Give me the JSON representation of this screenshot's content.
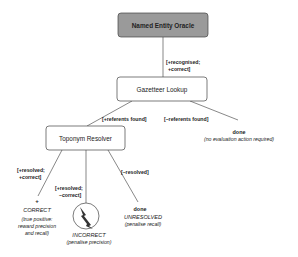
{
  "diagram": {
    "type": "decision-tree",
    "nodes": {
      "oracle": {
        "label": "Named Entity Oracle",
        "fill": "#9a9a9a"
      },
      "gazetteer": {
        "label": "Gazetteer Lookup",
        "fill": "#ffffff"
      },
      "resolver": {
        "label": "Toponym Resolver",
        "fill": "#ffffff"
      }
    },
    "edges": {
      "oracle_to_gazetteer": {
        "line1": "[+recognised;",
        "line2": "+correct]"
      },
      "gazetteer_to_resolver": {
        "label": "[+referents found]"
      },
      "gazetteer_to_done": {
        "label": "[–referents found]"
      },
      "resolver_to_correct": {
        "line1": "[+resolved;",
        "line2": "+correct]"
      },
      "resolver_to_incorrect": {
        "line1": "[+resolved;",
        "line2": "–correct]"
      },
      "resolver_to_unresolved": {
        "label": "[–resolved]"
      }
    },
    "terminals": {
      "no_action": {
        "title": "done",
        "note": "(no evaluation action required)"
      },
      "correct": {
        "symbol": "+",
        "outcome": "CORRECT",
        "note_line1": "(true positive:",
        "note_line2": "reward precision",
        "note_line3": "and recall)"
      },
      "incorrect": {
        "icon": "lightning-circle-icon",
        "outcome": "INCORRECT",
        "note": "(penalise precision)"
      },
      "unresolved": {
        "title": "done",
        "outcome": "UNRESOLVED",
        "note": "(penalise recall)"
      }
    }
  }
}
